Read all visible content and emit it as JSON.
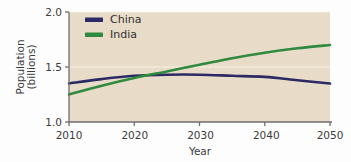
{
  "chart_data": {
    "type": "line",
    "title": "",
    "xlabel": "Year",
    "ylabel": "Population (billions)",
    "ylabel_line1": "Population",
    "ylabel_line2": "(billions)",
    "xlim": [
      2010,
      2050
    ],
    "ylim": [
      1.0,
      2.0
    ],
    "xticks": [
      2010,
      2020,
      2030,
      2040,
      2050
    ],
    "xtick_labels": [
      "2010",
      "2020",
      "2030",
      "2040",
      "2050"
    ],
    "yticks": [
      1.0,
      1.5,
      2.0
    ],
    "ytick_labels": [
      "1.0",
      "1.5",
      "2.0"
    ],
    "grid": "horizontal-faint",
    "legend_position": "top-left",
    "x": [
      2010,
      2015,
      2020,
      2025,
      2030,
      2035,
      2040,
      2045,
      2050
    ],
    "series": [
      {
        "name": "China",
        "color": "#2b2a66",
        "values": [
          1.35,
          1.39,
          1.42,
          1.43,
          1.43,
          1.42,
          1.41,
          1.38,
          1.35
        ]
      },
      {
        "name": "India",
        "color": "#2f8a3e",
        "values": [
          1.25,
          1.33,
          1.4,
          1.46,
          1.52,
          1.58,
          1.63,
          1.67,
          1.7
        ]
      }
    ],
    "colors": {
      "plot_background": "#e8dcc8",
      "figure_background": "#fdfdfd",
      "axis_line": "#6e6e6e",
      "gridline": "#f6f1e6",
      "text": "#3b3b3b"
    }
  },
  "legend": {
    "entries": [
      {
        "label": "China",
        "color": "#2b2a66"
      },
      {
        "label": "India",
        "color": "#2f8a3e"
      }
    ]
  },
  "axes": {
    "y_title_line1": "Population",
    "y_title_line2": "(billions)",
    "x_title": "Year",
    "y_tick_0": "1.0",
    "y_tick_1": "1.5",
    "y_tick_2": "2.0",
    "x_tick_0": "2010",
    "x_tick_1": "2020",
    "x_tick_2": "2030",
    "x_tick_3": "2040",
    "x_tick_4": "2050"
  }
}
